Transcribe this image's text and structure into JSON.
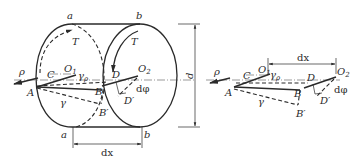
{
  "figure": {
    "left_view": {
      "labels": {
        "a_top": "a",
        "b_top": "b",
        "a_bottom": "a",
        "b_bottom": "b",
        "T_left": "T",
        "T_right": "T",
        "rho": "ρ",
        "C": "C",
        "O1": "O",
        "O1_sub": "1",
        "gamma_rho": "γ",
        "gamma_rho_sub": "ρ",
        "D": "D",
        "O2": "O",
        "O2_sub": "2",
        "A": "A",
        "B": "B",
        "gamma": "γ",
        "B_prime": "B′",
        "D_prime": "D′",
        "dphi": "dφ",
        "dx": "dx",
        "d": "d"
      }
    },
    "right_view": {
      "labels": {
        "rho": "ρ",
        "C": "C",
        "O1": "O",
        "O1_sub": "1",
        "gamma_rho": "γ",
        "gamma_rho_sub": "ρ",
        "dx": "dx",
        "D": "D",
        "O2": "O",
        "O2_sub": "2",
        "A": "A",
        "B": "B",
        "gamma": "γ",
        "B_prime": "B′",
        "D_prime": "D′",
        "dphi": "dφ"
      }
    }
  }
}
